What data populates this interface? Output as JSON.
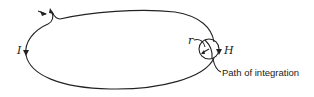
{
  "diagram": {
    "type": "physics-figure",
    "description_elements": [
      "current loop",
      "integration circle",
      "field direction"
    ],
    "labels": {
      "current": "I",
      "radius": "r",
      "field": "H",
      "path_annotation": "Path of integration"
    },
    "colors": {
      "line": "#222222",
      "background": "#ffffff"
    }
  }
}
